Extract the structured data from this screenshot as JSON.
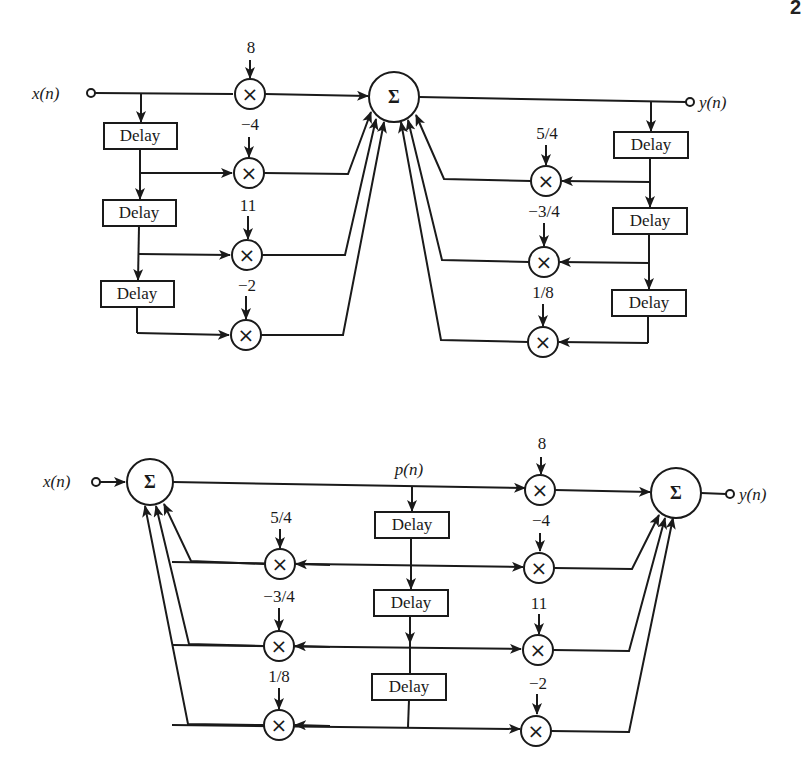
{
  "page": {
    "header_fragment": "...ERS",
    "page_number_fragment": "2"
  },
  "diagram_top": {
    "title": "Direct form realization (feedforward then feedback)",
    "input_label": "x(n)",
    "output_label": "y(n)",
    "sum_symbol": "Σ",
    "multiply_symbol": "×",
    "delay_label": "Delay",
    "feedforward_coefficients": [
      "8",
      "−4",
      "11",
      "−2"
    ],
    "feedback_coefficients": [
      "5/4",
      "−3/4",
      "1/8"
    ]
  },
  "diagram_bottom": {
    "title": "Canonical (direct form II) realization",
    "input_label": "x(n)",
    "output_label": "y(n)",
    "internal_signal_label": "p(n)",
    "sum_symbol": "Σ",
    "multiply_symbol": "×",
    "delay_label": "Delay",
    "feedforward_coefficients": [
      "8",
      "−4",
      "11",
      "−2"
    ],
    "feedback_coefficients": [
      "5/4",
      "−3/4",
      "1/8"
    ]
  }
}
